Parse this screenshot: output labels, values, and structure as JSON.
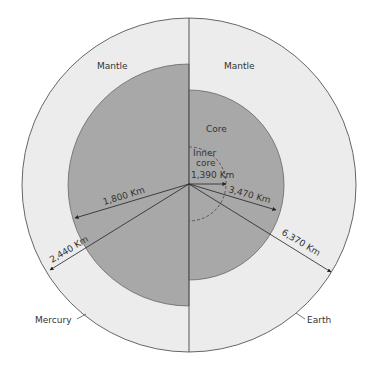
{
  "labels": {
    "mercury_mantle": "Mantle",
    "earth_mantle": "Mantle",
    "earth_core": "Core",
    "inner_core_line1": "Inner",
    "inner_core_line2": "core",
    "inner_core_radius": "1,390 Km",
    "earth_core_radius": "3,470 Km",
    "earth_radius": "6,370 Km",
    "mercury_core_radius": "1,800 Km",
    "mercury_radius": "2,440 Km",
    "mercury": "Mercury",
    "earth": "Earth"
  },
  "colors": {
    "mantle": "#ececec",
    "core": "#a8a8a8",
    "outline": "#666666",
    "text": "#333333"
  }
}
